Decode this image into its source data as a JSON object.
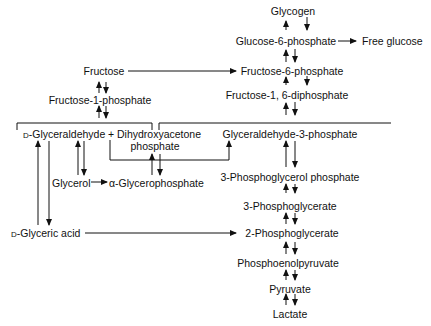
{
  "diagram": {
    "type": "metabolic-pathway",
    "nodes": {
      "glycogen": "Glycogen",
      "glucose_6_phosphate": "Glucose-6-phosphate",
      "free_glucose": "Free glucose",
      "fructose": "Fructose",
      "fructose_6_phosphate": "Fructose-6-phosphate",
      "fructose_1_phosphate": "Fructose-1-phosphate",
      "fructose_1_6_diphosphate": "Fructose-1, 6-diphosphate",
      "d_prefix": "D",
      "d_glyceraldehyde": "-Glyceraldehyde",
      "plus": "+",
      "dihydroxyacetone": "Dihydroxyacetone",
      "dihydroxyacetone_phosphate": "phosphate",
      "glyceraldehyde_3_phosphate": "Glyceraldehyde-3-phosphate",
      "glycerol": "Glycerol",
      "alpha_glycerophosphate": "α-Glycerophosphate",
      "phosphoglycerol_phosphate": "3-Phosphoglycerol phosphate",
      "phosphoglycerate_3": "3-Phosphoglycerate",
      "d_glyceric_acid": "-Glyceric acid",
      "phosphoglycerate_2": "2-Phosphoglycerate",
      "phosphoenolpyruvate": "Phosphoenolpyruvate",
      "pyruvate": "Pyruvate",
      "lactate": "Lactate"
    },
    "edges": [
      {
        "from": "Glucose-6-phosphate",
        "to": "Glycogen",
        "type": "reversible"
      },
      {
        "from": "Glucose-6-phosphate",
        "to": "Free glucose",
        "type": "forward"
      },
      {
        "from": "Fructose-6-phosphate",
        "to": "Glucose-6-phosphate",
        "type": "reversible"
      },
      {
        "from": "Fructose",
        "to": "Fructose-6-phosphate",
        "type": "forward"
      },
      {
        "from": "Fructose-1, 6-diphosphate",
        "to": "Fructose-6-phosphate",
        "type": "reversible"
      },
      {
        "from": "Fructose",
        "to": "Fructose-1-phosphate",
        "type": "reversible"
      },
      {
        "from": "Fructose-1-phosphate",
        "to": "D-Glyceraldehyde + Dihydroxyacetone phosphate",
        "type": "reversible"
      },
      {
        "from": "Glyceraldehyde-3-phosphate",
        "to": "Fructose-1, 6-diphosphate",
        "type": "reversible"
      },
      {
        "from": "Dihydroxyacetone phosphate",
        "to": "Glyceraldehyde-3-phosphate",
        "type": "forward"
      },
      {
        "from": "D-Glyceraldehyde",
        "to": "Glyceraldehyde-3-phosphate",
        "type": "forward"
      },
      {
        "from": "D-Glyceraldehyde",
        "to": "Glycerol",
        "type": "reversible"
      },
      {
        "from": "D-Glyceraldehyde",
        "to": "D-Glyceric acid",
        "type": "reversible"
      },
      {
        "from": "Glycerol",
        "to": "α-Glycerophosphate",
        "type": "forward"
      },
      {
        "from": "α-Glycerophosphate",
        "to": "Dihydroxyacetone phosphate",
        "type": "reversible"
      },
      {
        "from": "Glyceraldehyde-3-phosphate",
        "to": "3-Phosphoglycerol phosphate",
        "type": "reversible"
      },
      {
        "from": "3-Phosphoglycerol phosphate",
        "to": "3-Phosphoglycerate",
        "type": "reversible"
      },
      {
        "from": "3-Phosphoglycerate",
        "to": "2-Phosphoglycerate",
        "type": "reversible"
      },
      {
        "from": "D-Glyceric acid",
        "to": "2-Phosphoglycerate",
        "type": "forward"
      },
      {
        "from": "2-Phosphoglycerate",
        "to": "Phosphoenolpyruvate",
        "type": "reversible"
      },
      {
        "from": "Phosphoenolpyruvate",
        "to": "Pyruvate",
        "type": "reversible"
      },
      {
        "from": "Pyruvate",
        "to": "Lactate",
        "type": "reversible"
      }
    ]
  }
}
